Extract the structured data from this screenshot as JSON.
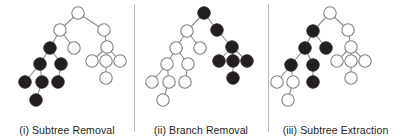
{
  "figure": {
    "width": 403,
    "height": 140,
    "background": "#ffffff",
    "node_radius": 6.2,
    "node_fill_light": "#ffffff",
    "node_fill_dark": "#231f20",
    "node_stroke_light": "#808080",
    "node_stroke_dark": "#231f20",
    "edge_color": "#8c8c8c",
    "edge_width": 1.1,
    "divider_color": "#b9b9b9",
    "divider_positions": [
      134,
      268
    ]
  },
  "panels": [
    {
      "id": "panel-subtree-removal",
      "caption": "(i) Subtree Removal",
      "left": 0,
      "width": 134,
      "nodes": [
        {
          "id": "n0",
          "x": 78,
          "y": 13,
          "state": "light"
        },
        {
          "id": "n1",
          "x": 60,
          "y": 30,
          "state": "light"
        },
        {
          "id": "n2",
          "x": 104,
          "y": 30,
          "state": "light"
        },
        {
          "id": "n3",
          "x": 50,
          "y": 48,
          "state": "dark"
        },
        {
          "id": "n4",
          "x": 74,
          "y": 48,
          "state": "light"
        },
        {
          "id": "n5",
          "x": 107,
          "y": 47,
          "state": "light"
        },
        {
          "id": "n6",
          "x": 40,
          "y": 64,
          "state": "dark"
        },
        {
          "id": "n7",
          "x": 61,
          "y": 64,
          "state": "dark"
        },
        {
          "id": "n8",
          "x": 92,
          "y": 61,
          "state": "light"
        },
        {
          "id": "n9",
          "x": 106,
          "y": 61,
          "state": "light"
        },
        {
          "id": "n10",
          "x": 120,
          "y": 61,
          "state": "light"
        },
        {
          "id": "n11",
          "x": 25,
          "y": 82,
          "state": "dark"
        },
        {
          "id": "n12",
          "x": 42,
          "y": 82,
          "state": "dark"
        },
        {
          "id": "n13",
          "x": 58,
          "y": 82,
          "state": "dark"
        },
        {
          "id": "n14",
          "x": 106,
          "y": 78,
          "state": "light"
        },
        {
          "id": "n15",
          "x": 36,
          "y": 100,
          "state": "dark"
        }
      ],
      "edges": [
        [
          "n0",
          "n1"
        ],
        [
          "n0",
          "n2"
        ],
        [
          "n1",
          "n3"
        ],
        [
          "n1",
          "n4"
        ],
        [
          "n2",
          "n5"
        ],
        [
          "n3",
          "n6"
        ],
        [
          "n3",
          "n7"
        ],
        [
          "n5",
          "n8"
        ],
        [
          "n5",
          "n9"
        ],
        [
          "n5",
          "n10"
        ],
        [
          "n6",
          "n11"
        ],
        [
          "n6",
          "n12"
        ],
        [
          "n7",
          "n13"
        ],
        [
          "n9",
          "n14"
        ],
        [
          "n12",
          "n15"
        ]
      ]
    },
    {
      "id": "panel-branch-removal",
      "caption": "(ii) Branch Removal",
      "left": 134,
      "width": 134,
      "nodes": [
        {
          "id": "n0",
          "x": 204,
          "y": 13,
          "state": "dark"
        },
        {
          "id": "n1",
          "x": 187,
          "y": 31,
          "state": "light"
        },
        {
          "id": "n2",
          "x": 217,
          "y": 30,
          "state": "dark"
        },
        {
          "id": "n3",
          "x": 176,
          "y": 48,
          "state": "light"
        },
        {
          "id": "n4",
          "x": 200,
          "y": 48,
          "state": "light"
        },
        {
          "id": "n5",
          "x": 232,
          "y": 47,
          "state": "dark"
        },
        {
          "id": "n6",
          "x": 167,
          "y": 64,
          "state": "light"
        },
        {
          "id": "n7",
          "x": 188,
          "y": 64,
          "state": "light"
        },
        {
          "id": "n8",
          "x": 219,
          "y": 61,
          "state": "dark"
        },
        {
          "id": "n9",
          "x": 233,
          "y": 61,
          "state": "dark"
        },
        {
          "id": "n10",
          "x": 247,
          "y": 61,
          "state": "dark"
        },
        {
          "id": "n11",
          "x": 152,
          "y": 82,
          "state": "light"
        },
        {
          "id": "n12",
          "x": 169,
          "y": 82,
          "state": "light"
        },
        {
          "id": "n13",
          "x": 185,
          "y": 82,
          "state": "light"
        },
        {
          "id": "n14",
          "x": 233,
          "y": 78,
          "state": "dark"
        },
        {
          "id": "n15",
          "x": 163,
          "y": 100,
          "state": "light"
        }
      ],
      "edges": [
        [
          "n0",
          "n1"
        ],
        [
          "n0",
          "n2"
        ],
        [
          "n1",
          "n3"
        ],
        [
          "n1",
          "n4"
        ],
        [
          "n2",
          "n5"
        ],
        [
          "n3",
          "n6"
        ],
        [
          "n3",
          "n7"
        ],
        [
          "n5",
          "n8"
        ],
        [
          "n5",
          "n9"
        ],
        [
          "n5",
          "n10"
        ],
        [
          "n6",
          "n11"
        ],
        [
          "n6",
          "n12"
        ],
        [
          "n7",
          "n13"
        ],
        [
          "n9",
          "n14"
        ],
        [
          "n12",
          "n15"
        ]
      ]
    },
    {
      "id": "panel-subtree-extraction",
      "caption": "(iii) Subtree Extraction",
      "left": 268,
      "width": 135,
      "nodes": [
        {
          "id": "n0",
          "x": 330,
          "y": 13,
          "state": "light"
        },
        {
          "id": "n1",
          "x": 313,
          "y": 31,
          "state": "dark"
        },
        {
          "id": "n2",
          "x": 348,
          "y": 30,
          "state": "light"
        },
        {
          "id": "n3",
          "x": 305,
          "y": 48,
          "state": "dark"
        },
        {
          "id": "n4",
          "x": 326,
          "y": 48,
          "state": "dark"
        },
        {
          "id": "n5",
          "x": 351,
          "y": 47,
          "state": "light"
        },
        {
          "id": "n6",
          "x": 291,
          "y": 65,
          "state": "dark"
        },
        {
          "id": "n7",
          "x": 313,
          "y": 65,
          "state": "dark"
        },
        {
          "id": "n8",
          "x": 337,
          "y": 61,
          "state": "light"
        },
        {
          "id": "n9",
          "x": 351,
          "y": 61,
          "state": "light"
        },
        {
          "id": "n10",
          "x": 365,
          "y": 61,
          "state": "light"
        },
        {
          "id": "n11",
          "x": 277,
          "y": 82,
          "state": "light"
        },
        {
          "id": "n12",
          "x": 293,
          "y": 82,
          "state": "light"
        },
        {
          "id": "n13",
          "x": 313,
          "y": 82,
          "state": "dark"
        },
        {
          "id": "n14",
          "x": 351,
          "y": 78,
          "state": "light"
        },
        {
          "id": "n15",
          "x": 288,
          "y": 100,
          "state": "light"
        }
      ],
      "edges": [
        [
          "n0",
          "n1"
        ],
        [
          "n0",
          "n2"
        ],
        [
          "n1",
          "n3"
        ],
        [
          "n1",
          "n4"
        ],
        [
          "n2",
          "n5"
        ],
        [
          "n3",
          "n6"
        ],
        [
          "n3",
          "n7"
        ],
        [
          "n5",
          "n8"
        ],
        [
          "n5",
          "n9"
        ],
        [
          "n5",
          "n10"
        ],
        [
          "n6",
          "n11"
        ],
        [
          "n6",
          "n12"
        ],
        [
          "n7",
          "n13"
        ],
        [
          "n9",
          "n14"
        ],
        [
          "n12",
          "n15"
        ]
      ]
    }
  ]
}
